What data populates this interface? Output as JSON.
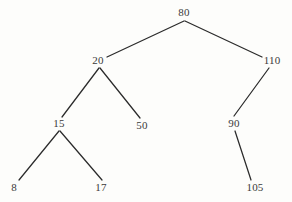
{
  "diagram": {
    "type": "binary-search-tree",
    "background_color": "#fdfdfb",
    "line_color": "#2b2b2b",
    "text_color": "#3a3a3a",
    "nodes": [
      {
        "id": "n80",
        "label": "80",
        "x": 184,
        "y": 7,
        "anchor_x": 184,
        "anchor_y": 21,
        "level": 0
      },
      {
        "id": "n20",
        "label": "20",
        "x": 98,
        "y": 55,
        "anchor_x": 99,
        "anchor_y": 68,
        "level": 1
      },
      {
        "id": "n110",
        "label": "110",
        "x": 272,
        "y": 55,
        "anchor_x": 269,
        "anchor_y": 68,
        "level": 1
      },
      {
        "id": "n15",
        "label": "15",
        "x": 59,
        "y": 118,
        "anchor_x": 59,
        "anchor_y": 131,
        "level": 2
      },
      {
        "id": "n50",
        "label": "50",
        "x": 142,
        "y": 120,
        "anchor_x": 142,
        "anchor_y": 120,
        "level": 2
      },
      {
        "id": "n90",
        "label": "90",
        "x": 234,
        "y": 118,
        "anchor_x": 235,
        "anchor_y": 131,
        "level": 2
      },
      {
        "id": "n8",
        "label": "8",
        "x": 14,
        "y": 182,
        "anchor_x": 14,
        "anchor_y": 182,
        "level": 3
      },
      {
        "id": "n17",
        "label": "17",
        "x": 101,
        "y": 182,
        "anchor_x": 101,
        "anchor_y": 182,
        "level": 3
      },
      {
        "id": "n105",
        "label": "105",
        "x": 255,
        "y": 182,
        "anchor_x": 255,
        "anchor_y": 182,
        "level": 3
      }
    ],
    "edges": [
      {
        "id": "e80-20",
        "from": "n80",
        "to": "n20",
        "x1": 184,
        "y1": 21,
        "x2": 107,
        "y2": 57
      },
      {
        "id": "e80-110",
        "from": "n80",
        "to": "n110",
        "x1": 185,
        "y1": 21,
        "x2": 262,
        "y2": 57
      },
      {
        "id": "e20-15",
        "from": "n20",
        "to": "n15",
        "x1": 99,
        "y1": 68,
        "x2": 62,
        "y2": 117
      },
      {
        "id": "e20-50",
        "from": "n20",
        "to": "n50",
        "x1": 100,
        "y1": 68,
        "x2": 140,
        "y2": 118
      },
      {
        "id": "e110-90",
        "from": "n110",
        "to": "n90",
        "x1": 269,
        "y1": 68,
        "x2": 234,
        "y2": 116
      },
      {
        "id": "e15-8",
        "from": "n15",
        "to": "n8",
        "x1": 59,
        "y1": 131,
        "x2": 19,
        "y2": 180
      },
      {
        "id": "e15-17",
        "from": "n15",
        "to": "n17",
        "x1": 60,
        "y1": 131,
        "x2": 102,
        "y2": 180
      },
      {
        "id": "e90-105",
        "from": "n90",
        "to": "n105",
        "x1": 235,
        "y1": 131,
        "x2": 251,
        "y2": 180
      }
    ]
  }
}
